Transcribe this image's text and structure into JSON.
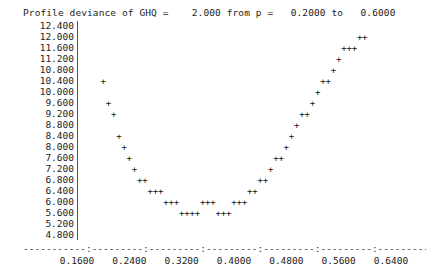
{
  "title": "Profile deviance of GHQ =    2.000 from p =   0.2000 to   0.6000",
  "header": {
    "label": "Profile deviance of GHQ =",
    "coefficient": "2.000",
    "from_label": "from p =",
    "p_from": "0.2000",
    "to_label": "to",
    "p_to": "0.6000"
  },
  "axis_dashes": "-----------:---------:---------:---------:---------:---------:---------:",
  "chart_data": {
    "type": "scatter",
    "title": "Profile deviance of GHQ =    2.000 from p =   0.2000 to   0.6000",
    "xlabel": "",
    "ylabel": "",
    "xlim": [
      0.16,
      0.64
    ],
    "ylim": [
      4.8,
      12.4
    ],
    "grid": false,
    "legend": "none",
    "marker": "+",
    "marker_color": "#111111",
    "xticks": [
      "0.1600",
      "0.2400",
      "0.3200",
      "0.4000",
      "0.4800",
      "0.5600",
      "0.6400"
    ],
    "xtick_values": [
      0.16,
      0.24,
      0.32,
      0.4,
      0.48,
      0.56,
      0.64
    ],
    "yticks": [
      "12.400",
      "12.000",
      "11.600",
      "11.200",
      "10.800",
      "10.400",
      "10.000",
      "9.600",
      "9.200",
      "8.800",
      "8.400",
      "8.000",
      "7.600",
      "7.200",
      "6.800",
      "6.400",
      "6.000",
      "5.600",
      "5.200",
      "4.800"
    ],
    "ytick_values": [
      12.4,
      12.0,
      11.6,
      11.2,
      10.8,
      10.4,
      10.0,
      9.6,
      9.2,
      8.8,
      8.4,
      8.0,
      7.6,
      7.2,
      6.8,
      6.4,
      6.0,
      5.6,
      5.2,
      4.8
    ],
    "series": [
      {
        "name": "profile deviance",
        "x": [
          0.2,
          0.208,
          0.216,
          0.224,
          0.232,
          0.24,
          0.248,
          0.256,
          0.264,
          0.272,
          0.28,
          0.288,
          0.296,
          0.304,
          0.312,
          0.32,
          0.328,
          0.336,
          0.344,
          0.352,
          0.36,
          0.368,
          0.376,
          0.384,
          0.392,
          0.4,
          0.408,
          0.416,
          0.424,
          0.432,
          0.44,
          0.448,
          0.456,
          0.464,
          0.472,
          0.48,
          0.488,
          0.496,
          0.504,
          0.512,
          0.52,
          0.528,
          0.536,
          0.544,
          0.552,
          0.56,
          0.568,
          0.576,
          0.584,
          0.592,
          0.6
        ],
        "y": [
          10.4,
          9.6,
          9.2,
          8.4,
          8.0,
          7.6,
          7.2,
          6.8,
          6.8,
          6.4,
          6.4,
          6.4,
          6.0,
          6.0,
          6.0,
          5.6,
          5.6,
          5.6,
          5.6,
          6.0,
          6.0,
          6.0,
          5.6,
          5.6,
          5.6,
          6.0,
          6.0,
          6.0,
          6.4,
          6.4,
          6.8,
          6.8,
          7.2,
          7.6,
          7.6,
          8.0,
          8.4,
          8.8,
          9.2,
          9.2,
          9.6,
          10.0,
          10.4,
          10.4,
          10.8,
          11.2,
          11.6,
          11.6,
          11.6,
          12.0,
          12.0
        ]
      }
    ]
  }
}
